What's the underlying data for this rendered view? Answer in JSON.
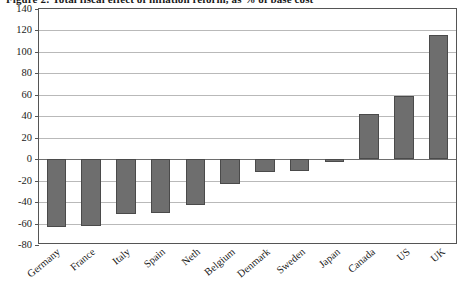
{
  "figure": {
    "title": "Figure 2:  Total fiscal effect of inflation reform, as % of base cost"
  },
  "chart_data": {
    "type": "bar",
    "title": "Figure 2:  Total fiscal effect of inflation reform, as % of base cost",
    "xlabel": "",
    "ylabel": "",
    "ylim": [
      -80,
      140
    ],
    "ytick_values": [
      140,
      120,
      100,
      80,
      60,
      40,
      20,
      0,
      -20,
      -40,
      -60,
      -80
    ],
    "ytick_labels": [
      "140",
      "120",
      "100",
      "80",
      "60",
      "40",
      "20",
      "0",
      "-20",
      "-40",
      "-60",
      "-80"
    ],
    "grid": true,
    "legend": "none",
    "bar_color": "#6e6e6e",
    "bar_edge_color": "#4a4a4a",
    "categories": [
      "Germany",
      "France",
      "Italy",
      "Spain",
      "Neth",
      "Belgium",
      "Denmark",
      "Sweden",
      "Japan",
      "Canada",
      "US",
      "UK"
    ],
    "values": [
      -63,
      -62,
      -51,
      -50,
      -43,
      -23,
      -12,
      -11,
      -3,
      42,
      59,
      116
    ]
  }
}
